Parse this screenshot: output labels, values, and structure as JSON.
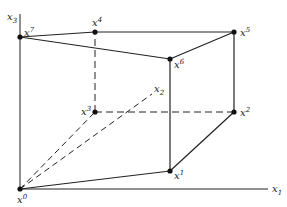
{
  "diagram": {
    "axes": {
      "x1": {
        "label": "x",
        "index": "1"
      },
      "x2": {
        "label": "x",
        "index": "2"
      },
      "x3": {
        "label": "x",
        "index": "3"
      }
    },
    "vertices": [
      {
        "id": "x0",
        "label": "x",
        "sup": "0"
      },
      {
        "id": "x1",
        "label": "x",
        "sup": "1"
      },
      {
        "id": "x2",
        "label": "x",
        "sup": "2"
      },
      {
        "id": "x3",
        "label": "x",
        "sup": "3"
      },
      {
        "id": "x4",
        "label": "x",
        "sup": "4"
      },
      {
        "id": "x5",
        "label": "x",
        "sup": "5"
      },
      {
        "id": "x6",
        "label": "x",
        "sup": "6"
      },
      {
        "id": "x7",
        "label": "x",
        "sup": "7"
      }
    ]
  }
}
